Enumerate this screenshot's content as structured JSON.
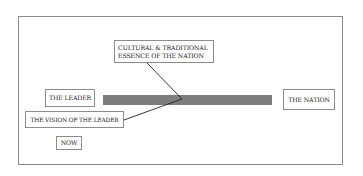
{
  "diagram": {
    "boxes": {
      "essence": {
        "lines": [
          "CULTURAL & TRADITIONAL",
          "ESSENCE OF THE NATION"
        ]
      },
      "leader": {
        "label": "THE LEADER"
      },
      "vision": {
        "label": "THE VISION OF THE LEADER"
      },
      "nation": {
        "label": "THE NATION"
      },
      "now": {
        "label": "NOW"
      }
    },
    "bar": {
      "color": "#7d7d7d",
      "from": "THE LEADER",
      "to": "THE NATION"
    },
    "connectors": [
      {
        "from": "CULTURAL & TRADITIONAL ESSENCE OF THE NATION",
        "to": "bar-convergence-point"
      },
      {
        "from": "THE VISION OF THE LEADER",
        "to": "bar-convergence-point"
      }
    ],
    "colors": {
      "border": "#8c8c8c",
      "line": "#222222",
      "text": "#222222"
    }
  }
}
